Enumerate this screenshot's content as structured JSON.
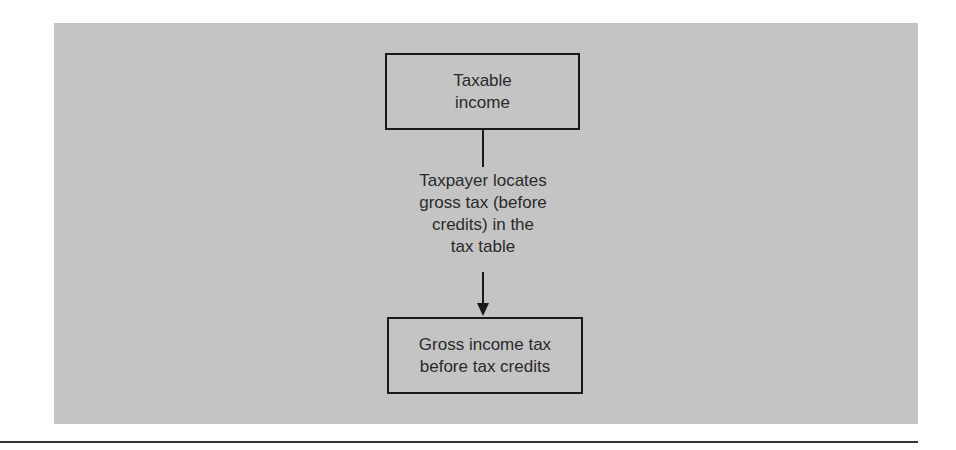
{
  "diagram": {
    "top_box": {
      "text": "Taxable\nincome"
    },
    "step_label": {
      "text": "Taxpayer locates\ngross tax (before\ncredits) in the\ntax table"
    },
    "bottom_box": {
      "text": "Gross income tax\nbefore tax credits"
    }
  },
  "colors": {
    "panel": "#c4c4c4",
    "stroke": "#1a1a1a",
    "text": "#2a2a2a"
  }
}
